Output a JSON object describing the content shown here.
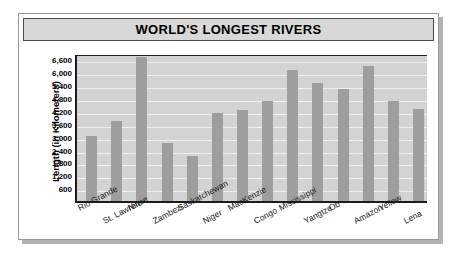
{
  "chart_data": {
    "type": "bar",
    "title": "WORLD'S LONGEST RIVERS",
    "xlabel": "",
    "ylabel": "Length (in Kilometers)",
    "ylim": [
      0,
      6900
    ],
    "grid": true,
    "legend": false,
    "categories": [
      "Rio Grande",
      "St. Lawrence",
      "Nile",
      "Zambezi",
      "Saskatchewan",
      "Niger",
      "MacKenzie",
      "Congo",
      "Mississippi",
      "Yangtze",
      "Ob",
      "Amazon",
      "Yellow",
      "Lena"
    ],
    "values": [
      3050,
      3750,
      6700,
      2700,
      2100,
      4100,
      4250,
      4650,
      6100,
      5500,
      5200,
      6300,
      4650,
      4300
    ],
    "yticks": [
      "600",
      "1,200",
      "1,800",
      "2,400",
      "3,000",
      "3,600",
      "4,200",
      "4,800",
      "5,400",
      "6,000",
      "6,600"
    ],
    "ytick_values": [
      600,
      1200,
      1800,
      2400,
      3000,
      3600,
      4200,
      4800,
      5400,
      6000,
      6600
    ],
    "bar_color": "#9e9e9e",
    "plot_background": "#d3d3d3",
    "gridline_color": "#f0f0f0",
    "title_background": "#d8d8d8",
    "axis_color": "#1c1c1c"
  }
}
